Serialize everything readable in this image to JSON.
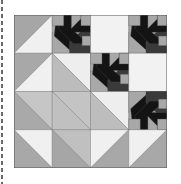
{
  "image": {
    "subject": "quilt-block",
    "grid": {
      "rows": 4,
      "cols": 4
    }
  },
  "palette": {
    "white": "#f2f2f2",
    "light": "#c4c4c4",
    "medium": "#a8a8a8",
    "mid_light": "#bdbdbd",
    "dark": "#3a3a3a",
    "black": "#141414",
    "seam": "#555555"
  },
  "cells": [
    {
      "row": 1,
      "col": 1,
      "type": "hst",
      "diag": "bl-tr",
      "a": "#a6a6a6",
      "b": "#f0f0f0"
    },
    {
      "row": 1,
      "col": 2,
      "type": "star",
      "orient": "tr"
    },
    {
      "row": 1,
      "col": 3,
      "type": "solid",
      "a": "#f2f2f2"
    },
    {
      "row": 1,
      "col": 4,
      "type": "star",
      "orient": "tr"
    },
    {
      "row": 2,
      "col": 1,
      "type": "hst",
      "diag": "bl-tr",
      "a": "#a8a8a8",
      "b": "#f0f0f0"
    },
    {
      "row": 2,
      "col": 2,
      "type": "hst",
      "diag": "tl-br",
      "a": "#eeeeee",
      "b": "#bcbcbc"
    },
    {
      "row": 2,
      "col": 3,
      "type": "star",
      "orient": "tr"
    },
    {
      "row": 2,
      "col": 4,
      "type": "solid",
      "a": "#f2f2f2"
    },
    {
      "row": 3,
      "col": 1,
      "type": "hst",
      "diag": "tl-br",
      "a": "#c6c6c6",
      "b": "#a9a9a9"
    },
    {
      "row": 3,
      "col": 2,
      "type": "hst",
      "diag": "tl-br",
      "a": "#c4c4c4",
      "b": "#c0c0c0"
    },
    {
      "row": 3,
      "col": 3,
      "type": "hst",
      "diag": "tl-br",
      "a": "#eeeeee",
      "b": "#bdbdbd"
    },
    {
      "row": 3,
      "col": 4,
      "type": "star",
      "orient": "br"
    },
    {
      "row": 4,
      "col": 1,
      "type": "hst",
      "diag": "tl-br",
      "a": "#f0f0f0",
      "b": "#a8a8a8"
    },
    {
      "row": 4,
      "col": 2,
      "type": "hst",
      "diag": "tl-br",
      "a": "#c0c0c0",
      "b": "#a6a6a6"
    },
    {
      "row": 4,
      "col": 3,
      "type": "hst",
      "diag": "bl-tr",
      "a": "#f0f0f0",
      "b": "#a8a8a8"
    },
    {
      "row": 4,
      "col": 4,
      "type": "hst",
      "diag": "bl-tr",
      "a": "#f0f0f0",
      "b": "#a8a8a8"
    }
  ]
}
